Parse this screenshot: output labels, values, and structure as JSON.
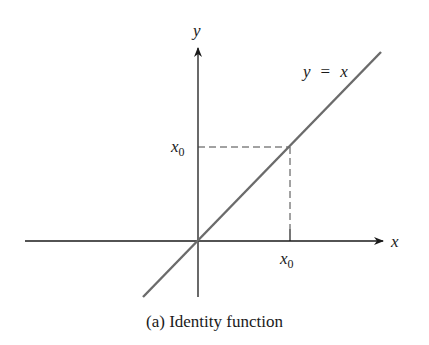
{
  "figure": {
    "caption": "(a) Identity function",
    "axis_x_label": "x",
    "axis_y_label": "y",
    "line_label_lhs": "y",
    "line_label_eq": "=",
    "line_label_rhs": "x",
    "tick_x_label_main": "x",
    "tick_x_label_sub": "0",
    "tick_y_label_main": "x",
    "tick_y_label_sub": "0",
    "colors": {
      "axes": "#1a1a1a",
      "line": "#6b6b6b",
      "dashed": "#444444"
    }
  }
}
